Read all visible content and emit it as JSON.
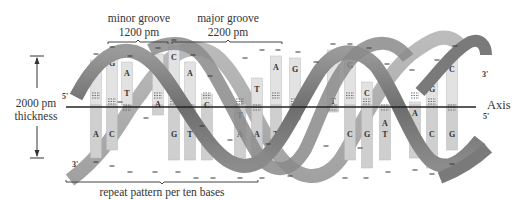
{
  "labels": {
    "minor_groove": {
      "title": "minor groove",
      "value": "1200 pm"
    },
    "major_groove": {
      "title": "major groove",
      "value": "2200 pm"
    },
    "thickness": {
      "value": "2000 pm",
      "title": "thickness"
    },
    "axis": "Axis",
    "repeat": "repeat pattern per ten bases",
    "ends": {
      "top_left": "5'",
      "bottom_left": "3'",
      "top_right": "3'",
      "bottom_right": "5'"
    }
  },
  "colors": {
    "strand_front": "#7d7d7d",
    "strand_back": "#a8a8a8",
    "base_bar": "#cfcfcf",
    "base_bar_light": "#e2e2e2",
    "axis": "#222222",
    "text": "#333333"
  },
  "base_pairs": [
    {
      "x": 96,
      "top": "T",
      "bottom": "A",
      "y1": 60,
      "y2": 158
    },
    {
      "x": 112,
      "top": "G",
      "bottom": "C",
      "y1": 52,
      "y2": 150
    },
    {
      "x": 127,
      "top": "A",
      "bottom": "T",
      "y1": 62,
      "y2": 104
    },
    {
      "x": 158,
      "top": "T",
      "bottom": "A",
      "y1": 54,
      "y2": 115
    },
    {
      "x": 174,
      "top": "C",
      "bottom": "G",
      "y1": 46,
      "y2": 160
    },
    {
      "x": 190,
      "top": "A",
      "bottom": "T",
      "y1": 62,
      "y2": 160
    },
    {
      "x": 207,
      "top": "C",
      "bottom": "G",
      "y1": 94,
      "y2": 160
    },
    {
      "x": 240,
      "top": "T",
      "bottom": "A",
      "y1": 104,
      "y2": 158
    },
    {
      "x": 257,
      "top": "T",
      "bottom": "A",
      "y1": 78,
      "y2": 168
    },
    {
      "x": 276,
      "top": "A",
      "bottom": "T",
      "y1": 56,
      "y2": 150
    },
    {
      "x": 295,
      "top": "G",
      "bottom": "C",
      "y1": 58,
      "y2": 120
    },
    {
      "x": 333,
      "top": "A",
      "bottom": "T",
      "y1": 50,
      "y2": 112
    },
    {
      "x": 350,
      "top": "G",
      "bottom": "C",
      "y1": 54,
      "y2": 160
    },
    {
      "x": 367,
      "top": "C",
      "bottom": "G",
      "y1": 82,
      "y2": 168
    },
    {
      "x": 385,
      "top": "A",
      "bottom": "T",
      "y1": 112,
      "y2": 160
    },
    {
      "x": 415,
      "top": "A",
      "bottom": "T",
      "y1": 102,
      "y2": 158
    },
    {
      "x": 432,
      "top": "G",
      "bottom": "C",
      "y1": 78,
      "y2": 168
    },
    {
      "x": 452,
      "top": "C",
      "bottom": "G",
      "y1": 58,
      "y2": 150
    }
  ],
  "phosphate_marks": [
    [
      96,
      54
    ],
    [
      112,
      47
    ],
    [
      130,
      56
    ],
    [
      158,
      48
    ],
    [
      174,
      40
    ],
    [
      193,
      55
    ],
    [
      210,
      76
    ],
    [
      245,
      58
    ],
    [
      262,
      50
    ],
    [
      278,
      50
    ],
    [
      298,
      52
    ],
    [
      316,
      62
    ],
    [
      333,
      44
    ],
    [
      350,
      44
    ],
    [
      369,
      48
    ],
    [
      387,
      64
    ],
    [
      412,
      70
    ],
    [
      437,
      60
    ],
    [
      455,
      46
    ],
    [
      120,
      102
    ],
    [
      146,
      118
    ],
    [
      202,
      126
    ],
    [
      230,
      140
    ],
    [
      268,
      144
    ],
    [
      326,
      146
    ],
    [
      360,
      148
    ],
    [
      96,
      162
    ],
    [
      112,
      166
    ],
    [
      130,
      172
    ],
    [
      155,
      172
    ],
    [
      178,
      172
    ],
    [
      196,
      178
    ],
    [
      213,
      178
    ],
    [
      240,
      178
    ],
    [
      262,
      178
    ],
    [
      290,
      176
    ],
    [
      345,
      178
    ],
    [
      366,
      178
    ],
    [
      388,
      172
    ],
    [
      415,
      170
    ],
    [
      432,
      174
    ],
    [
      452,
      164
    ]
  ]
}
